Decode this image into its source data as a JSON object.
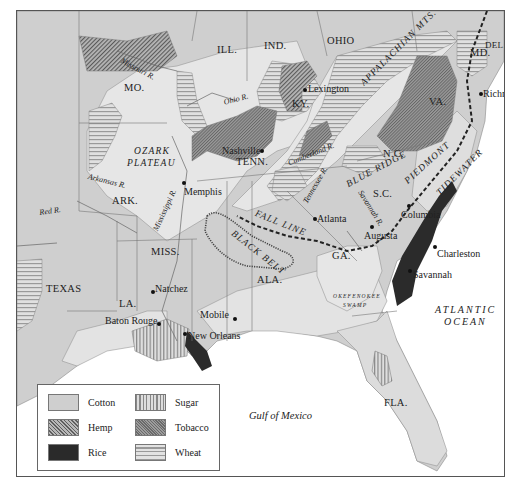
{
  "map": {
    "legend": {
      "items": [
        {
          "label": "Cotton",
          "pattern": "light-gray-fill"
        },
        {
          "label": "Sugar",
          "pattern": "vertical-stripes"
        },
        {
          "label": "Hemp",
          "pattern": "diagonal-hatch-coarse"
        },
        {
          "label": "Tobacco",
          "pattern": "diagonal-hatch-fine-dark"
        },
        {
          "label": "Rice",
          "pattern": "solid-black"
        },
        {
          "label": "Wheat",
          "pattern": "horizontal-stripes"
        }
      ]
    },
    "states": {
      "ill": "ILL.",
      "ind": "IND.",
      "ohio": "OHIO",
      "mo": "MO.",
      "ky": "KY.",
      "va": "VA.",
      "md": "MD.",
      "del": "DEL.",
      "tenn": "TENN.",
      "nc": "N.C.",
      "sc": "S.C.",
      "ark": "ARK.",
      "miss": "MISS.",
      "ala": "ALA.",
      "ga": "GA.",
      "texas": "TEXAS",
      "la": "LA.",
      "fla": "FLA."
    },
    "regions": {
      "appalachian": "APPALACHIAN MTS.",
      "ozark_1": "OZARK",
      "ozark_2": "PLATEAU",
      "blue_ridge": "BLUE RIDGE",
      "piedmont": "PIEDMONT",
      "tidewater": "TIDEWATER",
      "fall_line": "FALL LINE",
      "black_belt": "BLACK BELT",
      "okefenokee_1": "OKEFENOKEE",
      "okefenokee_2": "SWAMP"
    },
    "rivers": {
      "missouri": "Missouri R.",
      "ohio": "Ohio R.",
      "cumberland": "Cumberland R.",
      "arkansas": "Arkansas R.",
      "mississippi": "Mississippi R.",
      "red": "Red R.",
      "tennessee": "Tennessee R.",
      "savannah": "Savannah R."
    },
    "cities": {
      "lexington": "Lexington",
      "richmond": "Richmond",
      "nashville": "Nashville",
      "memphis": "Memphis",
      "atlanta": "Atlanta",
      "augusta": "Augusta",
      "columbia": "Columbia",
      "charleston": "Charleston",
      "savannah": "Savannah",
      "natchez": "Natchez",
      "baton_rouge": "Baton Rouge",
      "mobile": "Mobile",
      "new_orleans": "New Orleans"
    },
    "water": {
      "atlantic_1": "ATLANTIC",
      "atlantic_2": "OCEAN",
      "gulf": "Gulf of Mexico"
    }
  }
}
